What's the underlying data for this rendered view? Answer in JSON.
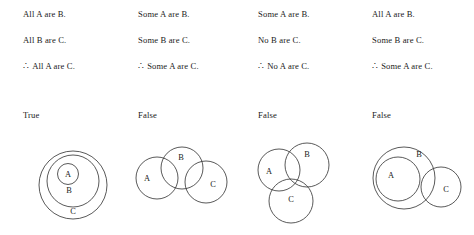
{
  "figure": {
    "title": "",
    "background_color": "#ffffff",
    "stroke_color": "#3b3b3b",
    "text_color": "#1a1a1a",
    "therefore_symbol": "∴"
  },
  "columns": [
    {
      "premise1": "All A are B.",
      "premise2": "All B are C.",
      "conclusion": "All A are C.",
      "verdict": "True",
      "diagram": {
        "type": "venn",
        "description": "A nested inside B nested inside C",
        "circles": [
          {
            "label": "C",
            "cx": 59,
            "cy": 45,
            "r": 34,
            "label_x": 59,
            "label_y": 74
          },
          {
            "label": "B",
            "cx": 59,
            "cy": 41,
            "r": 26,
            "label_x": 55,
            "label_y": 53
          },
          {
            "label": "A",
            "cx": 54,
            "cy": 34,
            "r": 10.5,
            "label_x": 54,
            "label_y": 37
          }
        ]
      }
    },
    {
      "premise1": "Some A are B.",
      "premise2": "Some B are C.",
      "conclusion": "Some A are C.",
      "verdict": "False",
      "diagram": {
        "type": "venn",
        "description": "A overlaps B, B overlaps C, A and C disjoint",
        "circles": [
          {
            "label": "A",
            "cx": 28,
            "cy": 38,
            "r": 21,
            "label_x": 18,
            "label_y": 41
          },
          {
            "label": "B",
            "cx": 53,
            "cy": 28,
            "r": 21,
            "label_x": 52,
            "label_y": 20
          },
          {
            "label": "C",
            "cx": 77,
            "cy": 42,
            "r": 21,
            "label_x": 84,
            "label_y": 47
          }
        ]
      }
    },
    {
      "premise1": "Some A are B.",
      "premise2": "No B are C.",
      "conclusion": "No A are C.",
      "verdict": "False",
      "diagram": {
        "type": "venn",
        "description": "A overlaps B above, C overlaps A below, B and C disjoint",
        "circles": [
          {
            "label": "A",
            "cx": 30,
            "cy": 30,
            "r": 21,
            "label_x": 20,
            "label_y": 34
          },
          {
            "label": "B",
            "cx": 58,
            "cy": 25,
            "r": 22,
            "label_x": 58,
            "label_y": 17
          },
          {
            "label": "C",
            "cx": 42,
            "cy": 61,
            "r": 22,
            "label_x": 42,
            "label_y": 62
          }
        ]
      }
    },
    {
      "premise1": "All A are B.",
      "premise2": "Some B are C.",
      "conclusion": "Some A are C.",
      "verdict": "False",
      "diagram": {
        "type": "venn",
        "description": "A nested inside B, C overlaps right edge of B, A and C disjoint",
        "circles": [
          {
            "label": "B",
            "cx": 41,
            "cy": 38,
            "r": 31,
            "label_x": 56,
            "label_y": 17
          },
          {
            "label": "A",
            "cx": 35,
            "cy": 39,
            "r": 22,
            "label_x": 28,
            "label_y": 38
          },
          {
            "label": "C",
            "cx": 78,
            "cy": 47,
            "r": 20,
            "label_x": 83,
            "label_y": 52
          }
        ]
      }
    }
  ]
}
